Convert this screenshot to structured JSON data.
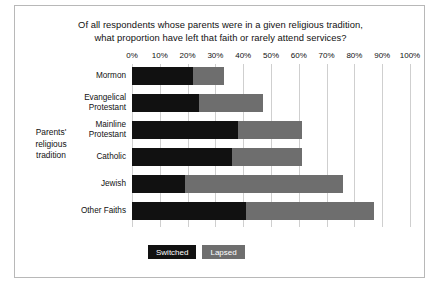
{
  "chart_data": {
    "type": "bar",
    "orientation": "horizontal",
    "stacked": true,
    "title": "Of all respondents whose parents were in a given religious tradition, what proportion have left that faith or rarely attend services?",
    "title_lines": [
      "Of all respondents whose parents were in a given religious tradition,",
      "what proportion have left that faith or rarely attend services?"
    ],
    "xlabel": "",
    "ylabel": "Parents' religious tradition",
    "ylabel_lines": [
      "Parents'",
      "religious",
      "tradition"
    ],
    "xlim": [
      0,
      100
    ],
    "xtick_labels": [
      "0%",
      "10%",
      "20%",
      "30%",
      "40%",
      "50%",
      "60%",
      "70%",
      "80%",
      "90%",
      "100%"
    ],
    "xtick_values": [
      0,
      10,
      20,
      30,
      40,
      50,
      60,
      70,
      80,
      90,
      100
    ],
    "grid": "vertical",
    "legend_position": "bottom-left",
    "categories": [
      "Mormon",
      "Evangelical Protestant",
      "Mainline Protestant",
      "Catholic",
      "Jewish",
      "Other Faiths"
    ],
    "category_lines": [
      [
        "Mormon"
      ],
      [
        "Evangelical",
        "Protestant"
      ],
      [
        "Mainline",
        "Protestant"
      ],
      [
        "Catholic"
      ],
      [
        "Jewish"
      ],
      [
        "Other Faiths"
      ]
    ],
    "series": [
      {
        "name": "Switched",
        "color": "#111111",
        "values": [
          22,
          24,
          38,
          36,
          19,
          41
        ]
      },
      {
        "name": "Lapsed",
        "color": "#6e6e6e",
        "values": [
          11,
          23,
          23,
          25,
          57,
          46
        ]
      }
    ],
    "totals": [
      33,
      47,
      61,
      61,
      76,
      87
    ]
  },
  "legend": {
    "items": [
      {
        "label": "Switched",
        "color": "#111111"
      },
      {
        "label": "Lapsed",
        "color": "#6e6e6e"
      }
    ]
  },
  "colors": {
    "switched": "#111111",
    "lapsed": "#6e6e6e",
    "gridline": "#cfcfcf",
    "border": "#b8b8b8",
    "background": "#ffffff",
    "text": "#111111"
  }
}
